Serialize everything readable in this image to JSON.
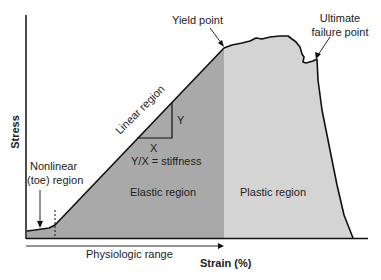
{
  "diagram": {
    "y_axis_label": "Stress",
    "x_axis_label": "Strain (%)",
    "annotations": {
      "yield_point": "Yield point",
      "ultimate_failure_line1": "Ultimate",
      "ultimate_failure_line2": "failure point",
      "linear_region": "Linear region",
      "triangle_y": "Y",
      "triangle_x": "X",
      "stiffness": "Y/X = stiffness",
      "elastic_region": "Elastic region",
      "plastic_region": "Plastic region",
      "nonlinear_line1": "Nonlinear",
      "nonlinear_line2": "(toe) region",
      "physiologic_range": "Physiologic range"
    },
    "colors": {
      "elastic_fill": "#a9a9a9",
      "plastic_fill": "#d4d4d4",
      "curve": "#111111",
      "background": "#ffffff"
    }
  }
}
